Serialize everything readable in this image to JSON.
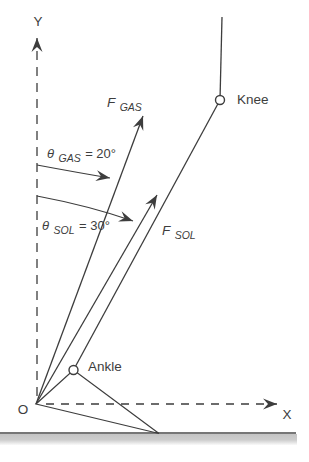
{
  "figure": {
    "title_hint": "Ankle force vector diagram (gastrocnemius and soleus)",
    "axes": {
      "y_label": "Y",
      "x_label": "X",
      "origin_label": "O"
    },
    "joints": {
      "knee_label": "Knee",
      "ankle_label": "Ankle"
    },
    "forces": {
      "gas": {
        "sym": "F",
        "sub": "GAS"
      },
      "sol": {
        "sym": "F",
        "sub": "SOL"
      }
    },
    "angles": {
      "gas": {
        "sym": "θ",
        "sub": "GAS",
        "eq": " = 20°",
        "value_deg": 20
      },
      "sol": {
        "sym": "θ",
        "sub": "SOL",
        "eq": " = 30°",
        "value_deg": 30
      }
    },
    "colors": {
      "ink": "#3d3d3d",
      "ground_line": "#4a4a4a",
      "ground_shade": "#c8c8c8",
      "background": "#ffffff"
    }
  }
}
